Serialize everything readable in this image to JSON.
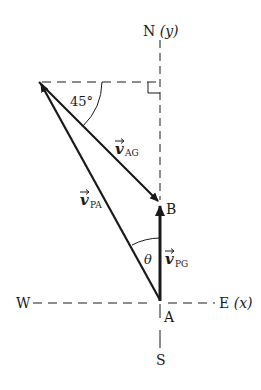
{
  "diagram": {
    "axes": {
      "north_label": "N",
      "north_axis": "(y)",
      "south_label": "S",
      "west_label": "W",
      "east_label": "E",
      "east_axis": "(x)"
    },
    "points": {
      "A": "A",
      "B": "B"
    },
    "vectors": {
      "v_AG": {
        "symbol": "v",
        "subscript": "AG"
      },
      "v_PA": {
        "symbol": "v",
        "subscript": "PA"
      },
      "v_PG": {
        "symbol": "v",
        "subscript": "PG"
      }
    },
    "angles": {
      "angle_45": "45°",
      "theta": "θ"
    },
    "colors": {
      "ink": "#1a1a1a",
      "background": "#ffffff"
    }
  }
}
